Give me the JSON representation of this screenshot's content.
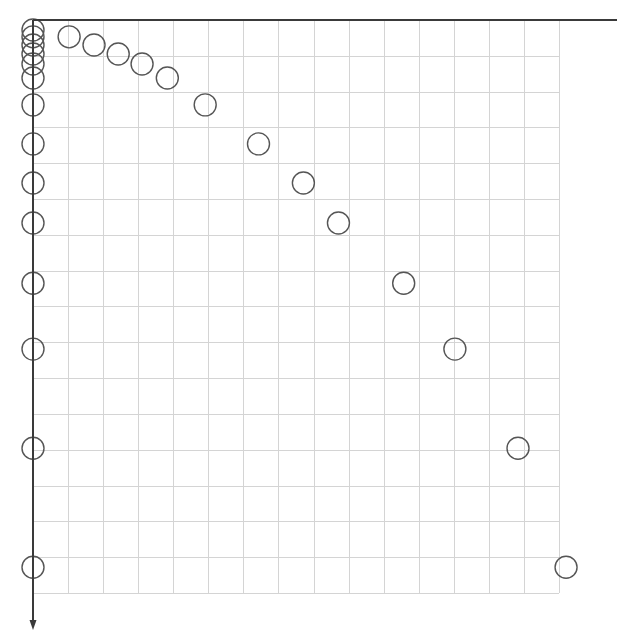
{
  "chart_data": {
    "type": "scatter",
    "title": "",
    "xlabel": "",
    "ylabel": "",
    "grid": true,
    "legend": null,
    "axis_orientation": "x increases right along top axis, y increases downward along left axis (arrow pointing down)",
    "xlim": [
      0,
      15
    ],
    "ylim": [
      0,
      16
    ],
    "grid_cells": {
      "columns": 15,
      "rows": 16
    },
    "series": [
      {
        "name": "points",
        "marker": "open-circle",
        "x": [
          1.03,
          1.74,
          2.43,
          3.11,
          3.83,
          4.91,
          6.43,
          7.71,
          8.71,
          10.57,
          12.03,
          13.83,
          15.2
        ],
        "y": [
          0.47,
          0.7,
          0.95,
          1.23,
          1.62,
          2.37,
          3.46,
          4.55,
          5.67,
          7.35,
          9.19,
          11.96,
          15.28
        ]
      },
      {
        "name": "y-axis projections",
        "marker": "open-circle",
        "x": [
          0,
          0,
          0,
          0,
          0,
          0,
          0,
          0,
          0,
          0,
          0,
          0,
          0,
          0
        ],
        "y": [
          0.28,
          0.47,
          0.7,
          0.95,
          1.23,
          1.62,
          2.37,
          3.46,
          4.55,
          5.67,
          7.35,
          9.19,
          11.96,
          15.28
        ]
      }
    ]
  },
  "layout": {
    "origin_px": [
      33,
      20
    ],
    "cell_w_px": 35.07,
    "cell_h_px": 35.81,
    "marker_radius_px": 11,
    "top_axis_end_px": 617,
    "left_axis_end_px": 630
  },
  "colors": {
    "grid": "#d4d4d4",
    "axis": "#3a3a3a",
    "marker": "#555555",
    "background": "#ffffff"
  }
}
